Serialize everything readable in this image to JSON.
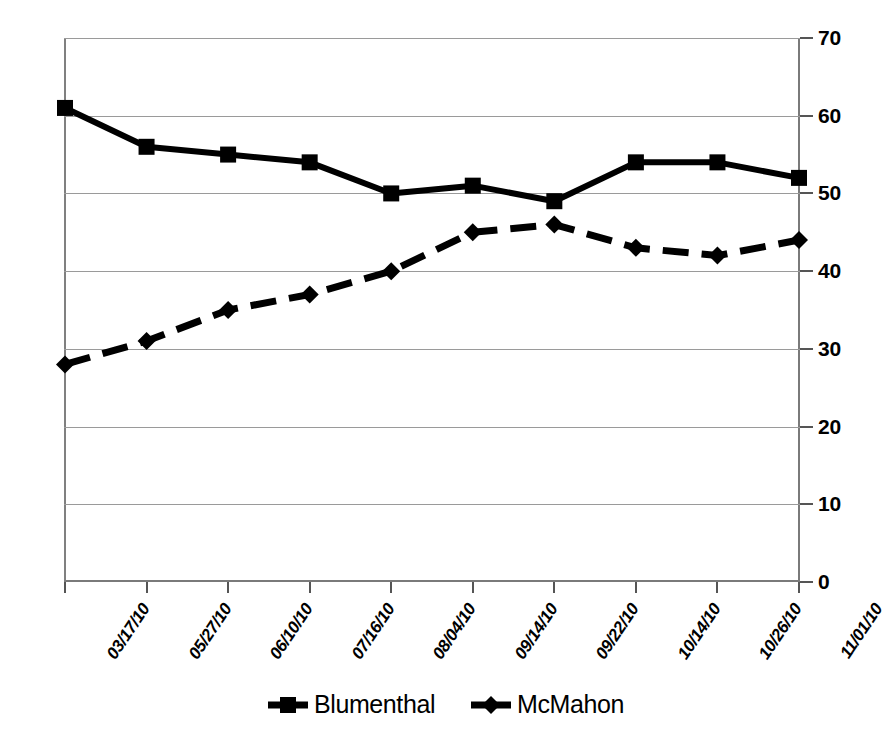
{
  "chart_data": {
    "type": "line",
    "title": "",
    "xlabel": "",
    "ylabel": "",
    "ylim": [
      0,
      70
    ],
    "ytick_step": 10,
    "yticks": [
      "0",
      "10",
      "20",
      "30",
      "40",
      "50",
      "60",
      "70"
    ],
    "grid": true,
    "legend_position": "bottom-center",
    "categories": [
      "03/17/10",
      "05/27/10",
      "06/10/10",
      "07/16/10",
      "08/04/10",
      "09/14/10",
      "09/22/10",
      "10/14/10",
      "10/26/10",
      "11/01/10"
    ],
    "series": [
      {
        "name": "Blumenthal",
        "marker": "square",
        "line_style": "solid",
        "color": "#000000",
        "values": [
          61,
          56,
          55,
          54,
          50,
          51,
          49,
          54,
          54,
          52
        ]
      },
      {
        "name": "McMahon",
        "marker": "diamond",
        "line_style": "dashed",
        "color": "#000000",
        "values": [
          28,
          31,
          35,
          37,
          40,
          45,
          46,
          43,
          42,
          44
        ]
      }
    ]
  },
  "legend": {
    "items": [
      {
        "label": "Blumenthal",
        "marker": "square-marker-icon"
      },
      {
        "label": "McMahon",
        "marker": "diamond-marker-icon"
      }
    ]
  },
  "axes": {
    "y_axis_name": "value-axis",
    "x_axis_name": "date-axis"
  }
}
